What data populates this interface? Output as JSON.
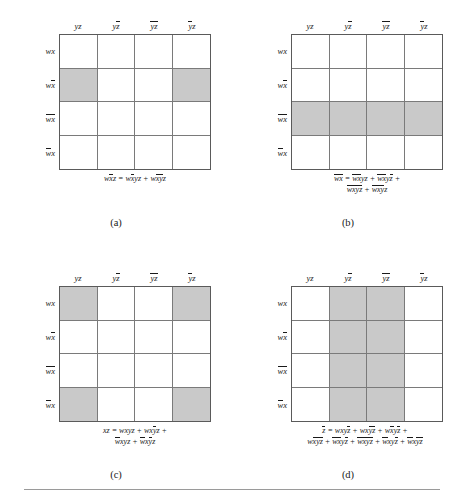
{
  "figure": {
    "type": "karnaugh-map-set",
    "variables": [
      "w",
      "x",
      "y",
      "z"
    ],
    "shading_color": "#c9c9c9",
    "grid_border_color": "#5a5a5a",
    "column_headers": [
      "yz",
      "yz̅",
      "y̅z̅",
      "y̅z"
    ],
    "row_labels": [
      "wx",
      "wx̅",
      "w̅x̅",
      "w̅x"
    ],
    "panels": [
      {
        "id": "a",
        "caption": "(a)",
        "column_headers": [
          "yz",
          "yz̅",
          "y̅z̅",
          "y̅z"
        ],
        "row_labels": [
          "wx",
          "wx̅",
          "w̅x̅",
          "w̅x"
        ],
        "shaded_cells": [
          [
            1,
            0
          ],
          [
            1,
            3
          ]
        ],
        "equation_lines": [
          "wx̅z = wx̅yz + wx̅y̅z"
        ]
      },
      {
        "id": "b",
        "caption": "(b)",
        "column_headers": [
          "yz",
          "yz̅",
          "y̅z̅",
          "y̅z"
        ],
        "row_labels": [
          "wx",
          "wx̅",
          "w̅x̅",
          "w̅x"
        ],
        "shaded_cells": [
          [
            2,
            0
          ],
          [
            2,
            1
          ],
          [
            2,
            2
          ],
          [
            2,
            3
          ]
        ],
        "equation_lines": [
          "w̅x̅ = w̅x̅yz + w̅x̅yz̅ +",
          "w̅x̅y̅z̅ + w̅x̅y̅z"
        ]
      },
      {
        "id": "c",
        "caption": "(c)",
        "column_headers": [
          "yz",
          "yz̅",
          "y̅z̅",
          "y̅z"
        ],
        "row_labels": [
          "wx",
          "wx̅",
          "w̅x̅",
          "w̅x"
        ],
        "shaded_cells": [
          [
            0,
            0
          ],
          [
            0,
            3
          ],
          [
            3,
            0
          ],
          [
            3,
            3
          ]
        ],
        "equation_lines": [
          "xz = wxyz + wxy̅z +",
          "w̅xyz + w̅xy̅z"
        ]
      },
      {
        "id": "d",
        "caption": "(d)",
        "column_headers": [
          "yz",
          "yz̅",
          "y̅z̅",
          "y̅z"
        ],
        "row_labels": [
          "wx",
          "wx̅",
          "w̅x̅",
          "w̅x"
        ],
        "shaded_cells": [
          [
            0,
            1
          ],
          [
            0,
            2
          ],
          [
            1,
            1
          ],
          [
            1,
            2
          ],
          [
            2,
            1
          ],
          [
            2,
            2
          ],
          [
            3,
            1
          ],
          [
            3,
            2
          ]
        ],
        "equation_lines": [
          "z̅ = wxyz̅ + wxy̅z̅ + wx̅yz̅ +",
          "wx̅y̅z̅ + w̅x̅yz̅ + w̅x̅y̅z̅ + w̅xyz̅ + w̅xy̅z̅"
        ]
      }
    ]
  }
}
